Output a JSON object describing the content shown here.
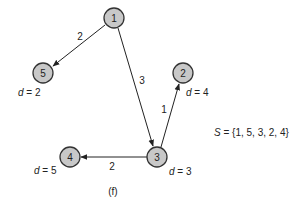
{
  "diagram": {
    "type": "directed-weighted-graph",
    "nodes": [
      {
        "id": "1",
        "label": "1",
        "x": 114,
        "y": 18
      },
      {
        "id": "5",
        "label": "5",
        "x": 43,
        "y": 73
      },
      {
        "id": "2",
        "label": "2",
        "x": 183,
        "y": 73
      },
      {
        "id": "3",
        "label": "3",
        "x": 157,
        "y": 157
      },
      {
        "id": "4",
        "label": "4",
        "x": 70,
        "y": 157
      }
    ],
    "edges": [
      {
        "from": "1",
        "to": "5",
        "weight": "2"
      },
      {
        "from": "1",
        "to": "3",
        "weight": "3"
      },
      {
        "from": "3",
        "to": "2",
        "weight": "1"
      },
      {
        "from": "3",
        "to": "4",
        "weight": "2"
      }
    ],
    "distances": [
      {
        "node": "5",
        "var": "d",
        "text": " = 2"
      },
      {
        "node": "2",
        "var": "d",
        "text": " = 4"
      },
      {
        "node": "3",
        "var": "d",
        "text": " = 3"
      },
      {
        "node": "4",
        "var": "d",
        "text": " = 5"
      }
    ],
    "set_label": {
      "var": "S",
      "text": " = {1, 5, 3, 2, 4}"
    },
    "caption": "(f)"
  }
}
